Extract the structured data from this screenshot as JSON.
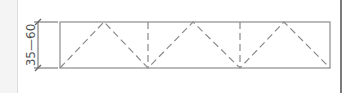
{
  "drawing": {
    "type": "truss-elevation-sketch",
    "dimension": {
      "label": "35—60",
      "orientation": "vertical",
      "x": 38,
      "y_top": 22,
      "y_bottom": 68
    },
    "frame": {
      "x": 60,
      "y": 22,
      "width": 270,
      "height": 46
    },
    "verticals_dashed_x": [
      148,
      240
    ],
    "diagonals_zigzag": [
      [
        60,
        68
      ],
      [
        104,
        22
      ],
      [
        148,
        68
      ],
      [
        193,
        22
      ],
      [
        240,
        68
      ],
      [
        284,
        22
      ],
      [
        330,
        68
      ]
    ],
    "colors": {
      "line": "#8c8c8c",
      "dashed": "#8a8a8a",
      "text": "#555555",
      "border_right": "#7a7a7a",
      "margin_bg": "#f4f4f4"
    }
  }
}
